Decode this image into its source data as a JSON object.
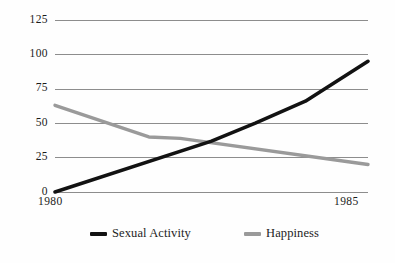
{
  "chart_data": {
    "type": "line",
    "title": "",
    "subtitle": "",
    "xlabel": "",
    "ylabel": "",
    "x": [
      1980,
      1985
    ],
    "xlim": [
      1980,
      1985
    ],
    "ylim": [
      0,
      125
    ],
    "xticks": [
      "1980",
      "1985"
    ],
    "yticks": [
      "0",
      "25",
      "50",
      "75",
      "100",
      "125"
    ],
    "ytick_values": [
      0,
      25,
      50,
      75,
      100,
      125
    ],
    "grid": "horizontal",
    "legend_position": "bottom",
    "series": [
      {
        "name": "Sexual Activity",
        "color": "#121212",
        "values": [
          0,
          95
        ],
        "points": [
          {
            "x": 1980.0,
            "y": 0
          },
          {
            "x": 1982.5,
            "y": 37
          },
          {
            "x": 1983.2,
            "y": 50
          },
          {
            "x": 1984.0,
            "y": 66
          },
          {
            "x": 1985.0,
            "y": 95
          }
        ]
      },
      {
        "name": "Happiness",
        "color": "#9a9a9a",
        "values": [
          63,
          20
        ],
        "points": [
          {
            "x": 1980.0,
            "y": 63
          },
          {
            "x": 1981.5,
            "y": 40
          },
          {
            "x": 1982.0,
            "y": 39
          },
          {
            "x": 1985.0,
            "y": 20
          }
        ]
      }
    ]
  },
  "axes": {
    "y_labels": [
      "125",
      "100",
      "75",
      "50",
      "25",
      "0"
    ],
    "x_labels": [
      "1980",
      "1985"
    ]
  },
  "legend": {
    "items": [
      {
        "label": "Sexual Activity",
        "color": "#121212"
      },
      {
        "label": "Happiness",
        "color": "#9a9a9a"
      }
    ]
  },
  "colors": {
    "background": "#fefefe",
    "gridline": "#8d8d8d",
    "text": "#1b1b1b",
    "series_black": "#121212",
    "series_gray": "#9a9a9a"
  }
}
